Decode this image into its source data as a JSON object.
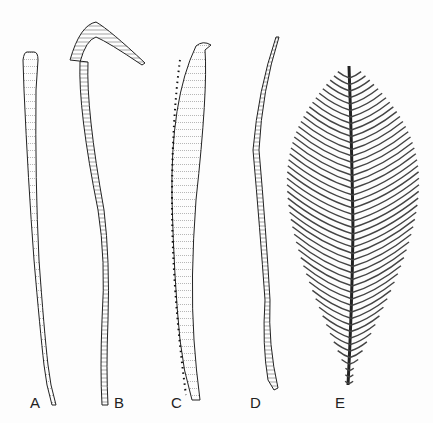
{
  "figure": {
    "panels": [
      {
        "id": "A",
        "label": "A",
        "label_pos": [
          30,
          403
        ]
      },
      {
        "id": "B",
        "label": "B",
        "label_pos": [
          114,
          403
        ]
      },
      {
        "id": "C",
        "label": "C",
        "label_pos": [
          171,
          403
        ]
      },
      {
        "id": "D",
        "label": "D",
        "label_pos": [
          250,
          403
        ]
      },
      {
        "id": "E",
        "label": "E",
        "label_pos": [
          336,
          403
        ]
      }
    ],
    "colors": {
      "ink": "#222222",
      "background": "#fdfdfd",
      "hatching": "#777777"
    }
  }
}
